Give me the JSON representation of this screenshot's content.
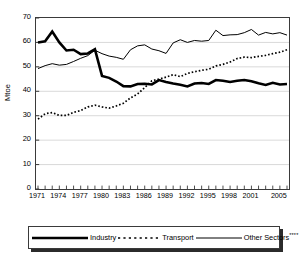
{
  "chart_data": {
    "type": "line",
    "title": "",
    "xlabel": "",
    "ylabel": "Mtoe",
    "ylim": [
      0,
      70
    ],
    "ytick_values": [
      0,
      10,
      20,
      30,
      40,
      50,
      60,
      70
    ],
    "ytick_labels": [
      "0",
      "10",
      "20",
      "30",
      "40",
      "50",
      "60",
      "70"
    ],
    "grid": "horizontal",
    "legend_position": "bottom",
    "x": [
      1971,
      1972,
      1973,
      1974,
      1975,
      1976,
      1977,
      1978,
      1979,
      1980,
      1981,
      1982,
      1983,
      1984,
      1985,
      1986,
      1987,
      1988,
      1989,
      1990,
      1991,
      1992,
      1993,
      1994,
      1995,
      1996,
      1997,
      1998,
      1999,
      2000,
      2001,
      2002,
      2003,
      2004,
      2005,
      2006
    ],
    "xtick_labels": [
      "1971",
      "1974",
      "1977",
      "1980",
      "1983",
      "1986",
      "1989",
      "1992",
      "1995",
      "1998",
      "2001",
      "2005"
    ],
    "xtick_values": [
      1971,
      1974,
      1977,
      1980,
      1983,
      1986,
      1989,
      1992,
      1995,
      1998,
      2001,
      2005
    ],
    "series": [
      {
        "name": "Industry",
        "style": "thick-solid",
        "color": "#000000",
        "values": [
          60.0,
          60.5,
          64.5,
          60.0,
          56.7,
          57.0,
          55.2,
          55.5,
          57.2,
          46.3,
          45.5,
          44.0,
          42.1,
          42.0,
          43.0,
          43.1,
          42.8,
          44.6,
          43.8,
          43.2,
          42.7,
          42.0,
          43.2,
          43.4,
          43.0,
          44.6,
          44.3,
          43.8,
          44.3,
          44.6,
          44.1,
          43.3,
          42.6,
          43.5,
          42.8,
          43.0
        ]
      },
      {
        "name": "Transport",
        "style": "dotted",
        "color": "#000000",
        "values": [
          28.6,
          30.8,
          31.3,
          30.1,
          30.1,
          31.4,
          32.1,
          33.6,
          34.3,
          33.6,
          33.1,
          34.0,
          35.1,
          37.3,
          38.9,
          41.5,
          44.3,
          45.0,
          45.8,
          46.8,
          46.0,
          47.3,
          48.0,
          48.6,
          49.0,
          50.4,
          51.0,
          52.0,
          53.4,
          54.0,
          53.8,
          54.3,
          54.7,
          55.4,
          56.0,
          57.0
        ]
      },
      {
        "name": "Other Sectors",
        "name_suffix": "****",
        "style": "thin-solid",
        "color": "#000000",
        "values": [
          49.3,
          50.5,
          51.3,
          50.7,
          51.0,
          52.2,
          53.5,
          54.6,
          56.8,
          55.4,
          54.4,
          53.9,
          53.1,
          57.0,
          58.6,
          59.0,
          57.3,
          56.6,
          55.5,
          59.8,
          61.1,
          60.0,
          60.8,
          60.5,
          60.8,
          65.0,
          62.8,
          63.1,
          63.2,
          64.0,
          65.3,
          63.0,
          64.1,
          63.5,
          64.0,
          63.0
        ]
      }
    ]
  },
  "legend": {
    "items": [
      {
        "label": "Industry",
        "suffix": ""
      },
      {
        "label": "Transport",
        "suffix": ""
      },
      {
        "label": "Other Sectors",
        "suffix": "****"
      }
    ]
  }
}
